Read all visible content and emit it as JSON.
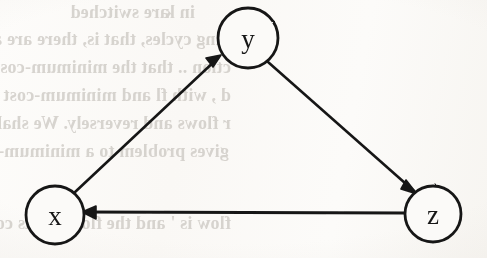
{
  "figure": {
    "kind": "directed-graph",
    "paper_color": "#fbfaf8",
    "ink_color": "#171717",
    "bleed_text_color": "#b9b4ae"
  },
  "graph": {
    "nodes": [
      {
        "id": "x",
        "label": "x",
        "cx": 55,
        "cy": 215,
        "r": 29
      },
      {
        "id": "y",
        "label": "y",
        "cx": 248,
        "cy": 38,
        "r": 30
      },
      {
        "id": "z",
        "label": "z",
        "cx": 433,
        "cy": 214,
        "r": 28
      }
    ],
    "edges": [
      {
        "id": "x-to-y",
        "from": "x",
        "to": "y",
        "label": "",
        "directed": true
      },
      {
        "id": "y-to-z",
        "from": "y",
        "to": "z",
        "label": "",
        "directed": true
      },
      {
        "id": "z-to-x",
        "from": "z",
        "to": "x",
        "label": "",
        "directed": true
      }
    ]
  },
  "bleed_text": {
    "note": "Faint mirrored show-through text from the reverse side of the scanned page",
    "lines": [
      {
        "text": "in k",
        "x": 292,
        "y": 2,
        "size": 18
      },
      {
        "text": "are switched",
        "x": 318,
        "y": 2,
        "size": 18
      },
      {
        "text": "ring cycles, that is, there are all cycles f",
        "x": 258,
        "y": 29,
        "size": 18
      },
      {
        "text": "ction .. that the minimum-cost flow with",
        "x": 256,
        "y": 57,
        "size": 18
      },
      {
        "text": "d  , with fl and  minimum-cost flow",
        "x": 256,
        "y": 85,
        "size": 18
      },
      {
        "text": "r flows and reversely. We shall now show",
        "x": 256,
        "y": 113,
        "size": 18
      },
      {
        "text": "gives problem to a minimum-cost flow",
        "x": 258,
        "y": 141,
        "size": 18
      },
      {
        "text": "flow is  ' and the flow x  ents consist",
        "x": 256,
        "y": 213,
        "size": 18
      }
    ]
  }
}
